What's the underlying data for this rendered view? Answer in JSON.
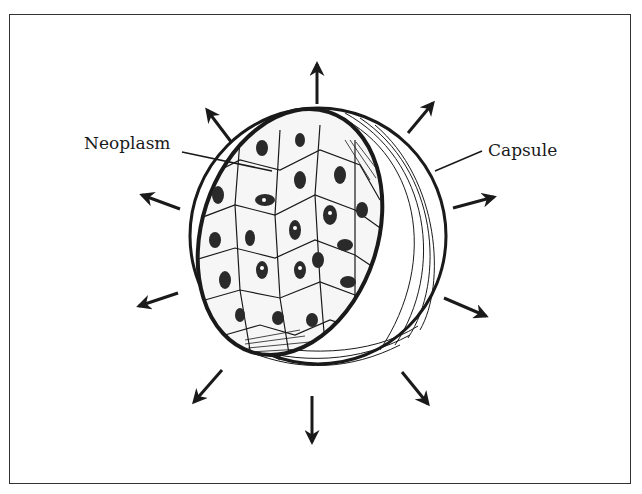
{
  "figure": {
    "labels": {
      "neoplasm": "Neoplasm",
      "capsule": "Capsule"
    },
    "arrow_count": 10,
    "colors": {
      "ink": "#1a1a1a",
      "background": "#ffffff",
      "frame": "#333333"
    }
  }
}
